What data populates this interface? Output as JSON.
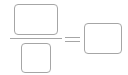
{
  "fraction": {
    "numerator": {
      "value": "",
      "placeholder": ""
    },
    "denominator": {
      "value": "",
      "placeholder": ""
    },
    "operator": "=",
    "result": {
      "value": "",
      "placeholder": ""
    }
  },
  "colors": {
    "border": "#a6a6a6",
    "background": "#ffffff"
  }
}
